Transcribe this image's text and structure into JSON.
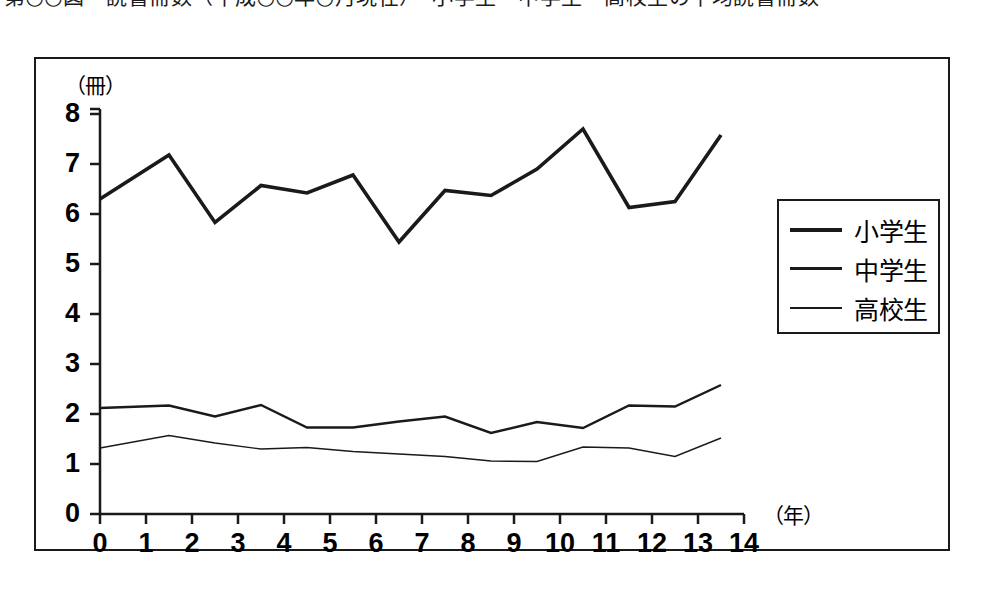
{
  "caption": {
    "text": "第○○図　読書冊数（平成○○年○月現在）　小学生・中学生・高校生の平均読書冊数"
  },
  "chart_data": {
    "type": "line",
    "title": "",
    "subtitle": "",
    "xlabel": "（年）",
    "ylabel": "（冊）",
    "xlim": [
      0,
      14
    ],
    "ylim": [
      0,
      8
    ],
    "grid": false,
    "legend_position": "right",
    "x_tick_labels": [
      "0",
      "1",
      "2",
      "3",
      "4",
      "5",
      "6",
      "7",
      "8",
      "9",
      "10",
      "11",
      "12",
      "13",
      "14"
    ],
    "y_tick_labels": [
      "0",
      "1",
      "2",
      "3",
      "4",
      "5",
      "6",
      "7",
      "8"
    ],
    "x": [
      0,
      1.5,
      2.5,
      3.5,
      4.5,
      5.5,
      6.5,
      7.5,
      8.5,
      9.5,
      10.5,
      11.5,
      12.5,
      13.5
    ],
    "series": [
      {
        "name": "小学生",
        "line_width": "thick",
        "color": "#1a1a1a",
        "values": [
          6.3,
          7.18,
          5.83,
          6.57,
          6.42,
          6.78,
          5.44,
          6.47,
          6.37,
          6.9,
          7.7,
          6.13,
          6.25,
          7.58
        ]
      },
      {
        "name": "中学生",
        "line_width": "medium",
        "color": "#1a1a1a",
        "values": [
          2.12,
          2.17,
          1.95,
          2.18,
          1.73,
          1.73,
          1.85,
          1.95,
          1.62,
          1.84,
          1.72,
          2.17,
          2.15,
          2.58
        ]
      },
      {
        "name": "高校生",
        "line_width": "thin",
        "color": "#1a1a1a",
        "values": [
          1.32,
          1.57,
          1.42,
          1.3,
          1.33,
          1.25,
          1.2,
          1.15,
          1.06,
          1.05,
          1.34,
          1.32,
          1.15,
          1.52
        ]
      }
    ]
  },
  "legend": {
    "items": [
      {
        "label": "小学生",
        "width_class": "w-thick"
      },
      {
        "label": "中学生",
        "width_class": "w-medium"
      },
      {
        "label": "高校生",
        "width_class": "w-thin"
      }
    ]
  }
}
